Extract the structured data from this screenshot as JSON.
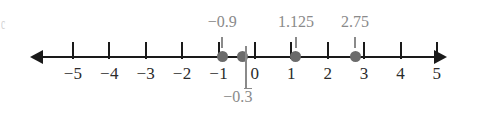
{
  "figure": {
    "edge_artifact": "c",
    "axis": {
      "left_arrow_icon": "arrow-left-icon",
      "right_arrow_icon": "arrow-right-icon"
    }
  },
  "chart_data": {
    "type": "scatter",
    "title": "",
    "xlabel": "",
    "ylabel": "",
    "orientation": "number-line",
    "xlim": [
      -5.8,
      5.8
    ],
    "grid": false,
    "legend": false,
    "axis_tick_values": [
      -5,
      -4,
      -3,
      -2,
      -1,
      0,
      1,
      2,
      3,
      4,
      5
    ],
    "axis_tick_labels": [
      "−5",
      "−4",
      "−3",
      "−2",
      "−1",
      "0",
      "1",
      "2",
      "3",
      "4",
      "5"
    ],
    "points": [
      {
        "value": -0.9,
        "label": "−0.9",
        "label_position": "above",
        "overline": "",
        "dot_color": "#6b6b6b"
      },
      {
        "value": -0.333333,
        "label": "−0.",
        "label_position": "below",
        "overline": "3",
        "dot_color": "#6b6b6b"
      },
      {
        "value": 1.125,
        "label": "1.125",
        "label_position": "above",
        "overline": "",
        "dot_color": "#6b6b6b"
      },
      {
        "value": 2.75,
        "label": "2.75",
        "label_position": "above",
        "overline": "",
        "dot_color": "#6b6b6b"
      }
    ],
    "colors": {
      "axis": "#1a1a1a",
      "tick_label": "#2b2b2b",
      "annotation": "#8a8a8a",
      "dot": "#6b6b6b"
    }
  }
}
